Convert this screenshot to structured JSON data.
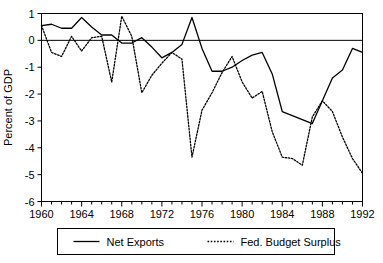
{
  "chart_data": {
    "type": "line",
    "title": "",
    "xlabel": "",
    "ylabel": "Percent of GDP",
    "xlim": [
      1960,
      1992
    ],
    "ylim": [
      -6,
      1
    ],
    "yticks": [
      1,
      0,
      -1,
      -2,
      -3,
      -4,
      -5,
      -6
    ],
    "ytick_labels": [
      "1",
      "0",
      "-1",
      "-2",
      "-3",
      "-4",
      "-5",
      "-6"
    ],
    "xticks": [
      1960,
      1964,
      1968,
      1972,
      1976,
      1980,
      1984,
      1988,
      1992
    ],
    "xtick_labels": [
      "1960",
      "1964",
      "1968",
      "1972",
      "1976",
      "1980",
      "1984",
      "1988",
      "1992"
    ],
    "x_minor_tick_interval": 1,
    "grid": false,
    "zero_line": true,
    "legend_position": "below",
    "x": [
      1960,
      1961,
      1962,
      1963,
      1964,
      1965,
      1966,
      1967,
      1968,
      1969,
      1970,
      1971,
      1972,
      1973,
      1974,
      1975,
      1976,
      1977,
      1978,
      1979,
      1980,
      1981,
      1982,
      1983,
      1984,
      1985,
      1986,
      1987,
      1988,
      1989,
      1990,
      1991,
      1992
    ],
    "series": [
      {
        "name": "Net Exports",
        "style": "solid",
        "color": "#000000",
        "values": [
          0.55,
          0.6,
          0.45,
          0.45,
          0.85,
          0.5,
          0.2,
          0.2,
          -0.1,
          -0.1,
          0.1,
          -0.25,
          -0.65,
          -0.45,
          -0.15,
          0.85,
          -0.3,
          -1.15,
          -1.15,
          -1.0,
          -0.75,
          -0.55,
          -0.45,
          -1.25,
          -2.65,
          -2.8,
          -2.95,
          -3.1,
          -2.25,
          -1.4,
          -1.1,
          -0.3,
          -0.45
        ]
      },
      {
        "name": "Fed. Budget Surplus",
        "style": "dotted",
        "color": "#000000",
        "values": [
          0.55,
          -0.45,
          -0.6,
          0.15,
          -0.4,
          0.1,
          0.15,
          -1.55,
          0.9,
          0.15,
          -1.95,
          -1.3,
          -0.85,
          -0.45,
          -0.7,
          -4.35,
          -2.6,
          -1.95,
          -1.2,
          -0.6,
          -1.55,
          -2.15,
          -1.9,
          -3.4,
          -4.35,
          -4.4,
          -4.65,
          -2.85,
          -2.25,
          -2.65,
          -3.6,
          -4.4,
          -4.95
        ]
      }
    ]
  },
  "legend": {
    "items": [
      {
        "label": "Net Exports",
        "style": "solid"
      },
      {
        "label": "Fed. Budget Surplus",
        "style": "dotted"
      }
    ]
  }
}
